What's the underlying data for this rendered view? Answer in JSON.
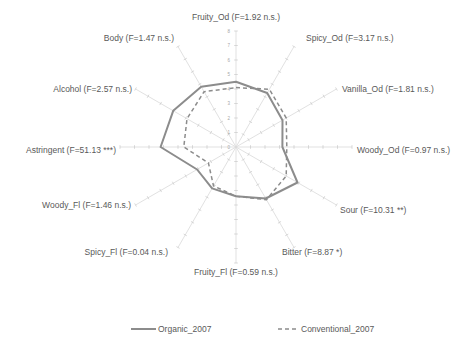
{
  "chart_data": {
    "type": "radar",
    "title": "",
    "categories": [
      "Fruity_Od (F=1.92 n.s.)",
      "Spicy_Od (F=3.17 n.s.)",
      "Vanilla_Od (F=1.81 n.s.)",
      "Woody_Od (F=0.97 n.s.)",
      "Sour (F=10.31 **)",
      "Bitter (F=8.87 *)",
      "Fruity_Fl (F=0.59 n.s.)",
      "Spicy_Fl (F=0.04 n.s.)",
      "Woody_Fl (F=1.46 n.s.)",
      "Astringent (F=51.13 ***)",
      "Alcohol (F=2.57 n.s.)",
      "Body (F=1.47 n.s.)"
    ],
    "series": [
      {
        "name": "Organic_2007",
        "style": "solid",
        "color": "#8c8c8c",
        "values": [
          4.5,
          4.3,
          3.7,
          3.2,
          4.9,
          4.1,
          3.4,
          3.3,
          3.1,
          5.2,
          5.0,
          4.8
        ]
      },
      {
        "name": "Conventional_2007",
        "style": "dashed",
        "color": "#8c8c8c",
        "values": [
          4.1,
          4.6,
          4.0,
          3.5,
          4.0,
          4.2,
          3.4,
          3.1,
          2.2,
          3.6,
          3.9,
          4.4
        ]
      }
    ],
    "radial_axis": {
      "min": 0,
      "max": 8,
      "ticks": [
        0,
        1,
        2,
        3,
        4,
        5,
        6,
        7,
        8
      ]
    },
    "grid": true,
    "legend_position": "bottom"
  },
  "legend": {
    "items": [
      {
        "label": "Organic_2007"
      },
      {
        "label": "Conventional_2007"
      }
    ]
  }
}
